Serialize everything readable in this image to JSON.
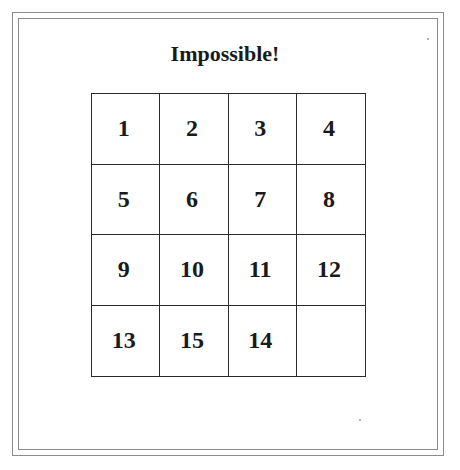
{
  "title": "Impossible!",
  "puzzle": {
    "rows": 4,
    "cols": 4,
    "tiles": [
      {
        "label": "1"
      },
      {
        "label": "2"
      },
      {
        "label": "3"
      },
      {
        "label": "4"
      },
      {
        "label": "5"
      },
      {
        "label": "6"
      },
      {
        "label": "7"
      },
      {
        "label": "8"
      },
      {
        "label": "9"
      },
      {
        "label": "10"
      },
      {
        "label": "11"
      },
      {
        "label": "12"
      },
      {
        "label": "13"
      },
      {
        "label": "15"
      },
      {
        "label": "14"
      },
      {
        "label": ""
      }
    ]
  },
  "colors": {
    "grid_line": "#2a2a2a",
    "frame_line": "#8a8a8a",
    "text": "#1a1a1a",
    "background": "#ffffff"
  }
}
